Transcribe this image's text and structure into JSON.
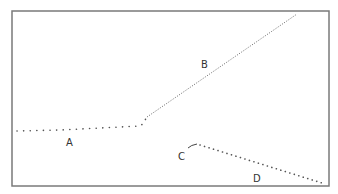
{
  "diagram": {
    "frame": {
      "x": 12,
      "y": 11,
      "width": 317,
      "height": 175,
      "stroke": "#7a7a7a"
    },
    "colors": {
      "line": "#555555",
      "label": "#333333"
    },
    "curves": [
      {
        "id": "A",
        "label": "A",
        "style": "coarse-dotted",
        "points": [
          [
            17,
            131
          ],
          [
            60,
            130
          ],
          [
            100,
            128
          ],
          [
            140,
            126
          ],
          [
            144,
            123
          ],
          [
            146,
            118
          ]
        ],
        "label_pos": [
          70,
          146
        ]
      },
      {
        "id": "B",
        "label": "B",
        "style": "fine-dotted",
        "points": [
          [
            147,
            117
          ],
          [
            297,
            14
          ]
        ],
        "label_pos": [
          205,
          68
        ]
      },
      {
        "id": "C",
        "label": "C",
        "style": "solid-short-curve",
        "points": [
          [
            188,
            148
          ],
          [
            192,
            145
          ],
          [
            197,
            144
          ]
        ],
        "label_pos": [
          181,
          160
        ]
      },
      {
        "id": "D",
        "label": "D",
        "style": "coarse-dotted",
        "points": [
          [
            200,
            145
          ],
          [
            322,
            183
          ]
        ],
        "label_pos": [
          256,
          182
        ]
      }
    ]
  }
}
